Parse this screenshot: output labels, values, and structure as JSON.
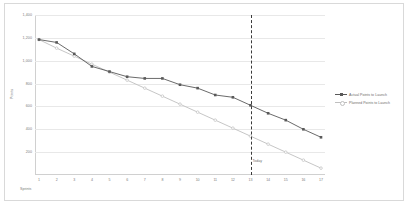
{
  "chart_data": {
    "type": "line",
    "title": "",
    "xlabel": "Sprints",
    "ylabel": "Points",
    "ylim": [
      0,
      1400
    ],
    "yticks": [
      "1,400",
      "1,200",
      "1,000",
      "800",
      "600",
      "400",
      "200"
    ],
    "ytick_values": [
      1400,
      1200,
      1000,
      800,
      600,
      400,
      200
    ],
    "grid": true,
    "legend_position": "right",
    "x": [
      1,
      2,
      3,
      4,
      5,
      6,
      7,
      8,
      9,
      10,
      11,
      12,
      13,
      14,
      15,
      16,
      17
    ],
    "xticks": [
      "1",
      "2",
      "3",
      "4",
      "5",
      "6",
      "7",
      "8",
      "9",
      "10",
      "11",
      "12",
      "13",
      "14",
      "15",
      "16",
      "17"
    ],
    "series": [
      {
        "name": "Actual Points to Launch",
        "color": "#595959",
        "marker": "square",
        "values": [
          1185,
          1160,
          1060,
          950,
          905,
          860,
          845,
          845,
          790,
          760,
          700,
          680,
          610,
          540,
          480,
          400,
          330
        ]
      },
      {
        "name": "Planned Points to Launch",
        "color": "#bfbfbf",
        "marker": "circle",
        "values": [
          1185,
          1110,
          1040,
          970,
          900,
          830,
          760,
          690,
          620,
          550,
          480,
          410,
          340,
          270,
          200,
          130,
          60
        ]
      }
    ],
    "annotations": [
      {
        "name": "today-marker",
        "label": "Today",
        "x": 13,
        "style": "dashed-vertical-line",
        "color": "#3a3a3a"
      }
    ]
  },
  "legend": {
    "items": [
      {
        "label": "Actual Points to Launch",
        "color": "#595959",
        "marker": "square"
      },
      {
        "label": "Planned Points to Launch",
        "color": "#bfbfbf",
        "marker": "circle"
      }
    ]
  },
  "axes": {
    "y_title": "Points",
    "x_title": "Sprints"
  },
  "colors": {
    "actual": "#595959",
    "planned": "#bfbfbf",
    "grid": "#e8e8e8",
    "axis_text": "#7a7a7a",
    "frame_border": "#d9d9d9",
    "today_line": "#3a3a3a"
  }
}
